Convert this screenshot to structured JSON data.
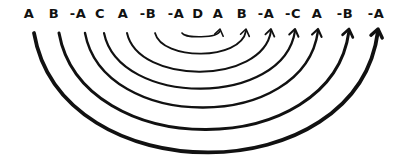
{
  "diagram": {
    "stroke_color": "#111111",
    "tokens": [
      {
        "label": "A",
        "x": 29
      },
      {
        "label": "B",
        "x": 54
      },
      {
        "label": "-A",
        "x": 78
      },
      {
        "label": "C",
        "x": 100
      },
      {
        "label": "A",
        "x": 123
      },
      {
        "label": "-B",
        "x": 148
      },
      {
        "label": "-A",
        "x": 176
      },
      {
        "label": "D",
        "x": 198
      },
      {
        "label": "A",
        "x": 218
      },
      {
        "label": "B",
        "x": 242
      },
      {
        "label": "-A",
        "x": 266
      },
      {
        "label": "-C",
        "x": 293
      },
      {
        "label": "A",
        "x": 317
      },
      {
        "label": "-B",
        "x": 345
      },
      {
        "label": "-A",
        "x": 376
      }
    ],
    "arcs": [
      {
        "from_index": 6,
        "to_index": 8,
        "x1": 182,
        "x2": 220,
        "bottom": 37,
        "width": 1.6
      },
      {
        "from_index": 5,
        "to_index": 9,
        "x1": 155,
        "x2": 246,
        "bottom": 54,
        "width": 1.8
      },
      {
        "from_index": 4,
        "to_index": 10,
        "x1": 127,
        "x2": 271,
        "bottom": 72,
        "width": 2.0
      },
      {
        "from_index": 3,
        "to_index": 11,
        "x1": 104,
        "x2": 295,
        "bottom": 89,
        "width": 2.2
      },
      {
        "from_index": 2,
        "to_index": 12,
        "x1": 85,
        "x2": 318,
        "bottom": 108,
        "width": 2.4
      },
      {
        "from_index": 1,
        "to_index": 13,
        "x1": 59,
        "x2": 349,
        "bottom": 130,
        "width": 3.0
      },
      {
        "from_index": 0,
        "to_index": 14,
        "x1": 34,
        "x2": 378,
        "bottom": 153,
        "width": 3.8
      }
    ]
  }
}
